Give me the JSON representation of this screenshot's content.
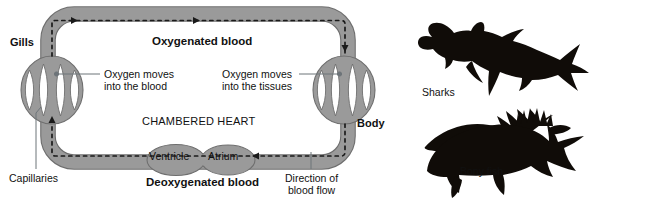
{
  "diagram": {
    "title_region": "single-circuit fish circulatory system",
    "labels": {
      "gills": "Gills",
      "body": "Body",
      "oxygenated": "Oxygenated blood",
      "deoxygenated": "Deoxygenated blood",
      "chambered_heart": "CHAMBERED HEART",
      "ventricle": "Ventricle",
      "atrium": "Atrium",
      "oxygen_into_blood_line1": "Oxygen moves",
      "oxygen_into_blood_line2": "into the blood",
      "oxygen_into_tissues_line1": "Oxygen moves",
      "oxygen_into_tissues_line2": "into the tissues",
      "capillaries": "Capillaries",
      "direction_line1": "Direction of",
      "direction_line2": "blood flow"
    }
  },
  "fish": {
    "shark_label": "Sharks",
    "bony_fish_label": "Bony fish"
  },
  "colors": {
    "vessel_fill": "#9a9a9a",
    "vessel_stroke": "#6e6e6e",
    "background": "#ffffff",
    "silhouette": "#100c08",
    "text": "#111111",
    "leader_line": "#6d7479"
  }
}
